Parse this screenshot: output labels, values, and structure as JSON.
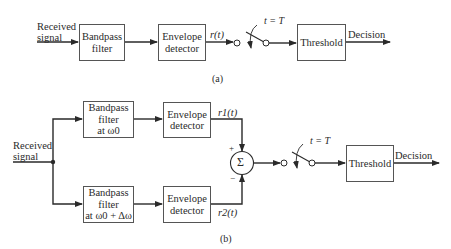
{
  "diagram_a": {
    "caption": "(a)",
    "input_label_line1": "Received",
    "input_label_line2": "signal",
    "blocks": [
      {
        "id": "bandpass",
        "line1": "Bandpass",
        "line2": "filter"
      },
      {
        "id": "envelope",
        "line1": "Envelope",
        "line2": "detector"
      },
      {
        "id": "threshold",
        "line1": "Threshold"
      }
    ],
    "signal_label": "r(t)",
    "switch_label": "t = T",
    "output_label": "Decision"
  },
  "diagram_b": {
    "caption": "(b)",
    "input_label_line1": "Received",
    "input_label_line2": "signal",
    "upper_branch": {
      "filter_line1": "Bandpass",
      "filter_line2": "filter",
      "filter_line3": "at ω0",
      "detector_line1": "Envelope",
      "detector_line2": "detector",
      "signal_label": "r1(t)"
    },
    "lower_branch": {
      "filter_line1": "Bandpass",
      "filter_line2": "filter",
      "filter_line3": "at ω0 + Δω",
      "detector_line1": "Envelope",
      "detector_line2": "detector",
      "signal_label": "r2(t)"
    },
    "summer_symbol": "Σ",
    "plus_sign": "+",
    "minus_sign": "−",
    "switch_label": "t = T",
    "threshold_label": "Threshold",
    "output_label": "Decision"
  }
}
